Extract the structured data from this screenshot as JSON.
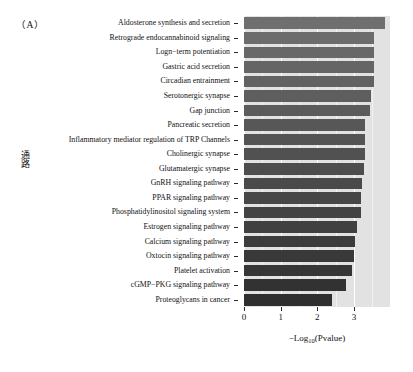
{
  "figure": {
    "panel_label": "（A）",
    "y_axis_title": "通路",
    "x_axis_title_prefix": "−Log",
    "x_axis_title_sub": "10",
    "x_axis_title_suffix": "(Pvalue)",
    "panel_background": "#e2e2e2",
    "bar_color_light": "#6f6f6f",
    "bar_color_dark": "#2f2f2f",
    "grid_color": "#ffffff"
  },
  "chart_data": {
    "type": "bar",
    "orientation": "horizontal",
    "title": "（A）",
    "xlabel": "−Log10(Pvalue)",
    "ylabel": "通路",
    "xlim": [
      0,
      3.98
    ],
    "xticks": [
      0,
      1,
      2,
      3
    ],
    "xtick_labels": [
      "0",
      "1",
      "2",
      "3"
    ],
    "grid": true,
    "grid_axis": "x",
    "legend": "none",
    "categories": [
      "Aldosterone synthesis and secretion",
      "Retrograde endocannabinoid signaling",
      "Logn−term potentiation",
      "Gastric acid secretion",
      "Circadian entrainment",
      "Serotonergic synapse",
      "Gap junction",
      "Pancreatic secretion",
      "Inflammatory mediator regulation of TRP Channels",
      "Cholinergic synapse",
      "Glutamatergic synapse",
      "GnRH signaling pathway",
      "PPAR signaling pathway",
      "Phosphatidylinositol signaling system",
      "Estrogen signaling pathway",
      "Calcium signaling pathway",
      "Oxtocin signaling pathway",
      "Platelet activation",
      "cGMP−PKG signaling pathway",
      "Proteoglycans in cancer"
    ],
    "values": [
      3.84,
      3.55,
      3.55,
      3.55,
      3.55,
      3.45,
      3.43,
      3.3,
      3.3,
      3.3,
      3.28,
      3.22,
      3.2,
      3.2,
      3.08,
      3.03,
      2.99,
      2.94,
      2.78,
      2.4
    ]
  }
}
